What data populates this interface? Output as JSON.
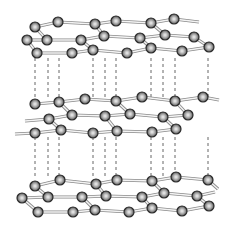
{
  "diagram": {
    "width": 235,
    "height": 229,
    "atom_radius": 5,
    "colors": {
      "background": "#ffffff",
      "atom_outline": "#2a2a2a",
      "atom_highlight": "#e8e8e8",
      "atom_shade": "#6e6e6e",
      "bond": "#8a8a8a",
      "dashed_line": "#555555"
    },
    "dashed_lines": {
      "x": [
        35,
        48,
        59,
        93,
        105,
        116,
        151,
        163,
        175,
        208
      ],
      "segments": [
        [
          58,
          98
        ],
        [
          137,
          176
        ]
      ]
    },
    "layers": [
      {
        "name": "top-layer",
        "atoms": [
          [
            35,
            27
          ],
          [
            58,
            22
          ],
          [
            95,
            24
          ],
          [
            116,
            21
          ],
          [
            151,
            23
          ],
          [
            174,
            19
          ],
          [
            27,
            40
          ],
          [
            47,
            40
          ],
          [
            81,
            40
          ],
          [
            104,
            36
          ],
          [
            140,
            38
          ],
          [
            165,
            35
          ],
          [
            194,
            37
          ],
          [
            37,
            53
          ],
          [
            72,
            53
          ],
          [
            93,
            50
          ],
          [
            127,
            53
          ],
          [
            151,
            48
          ],
          [
            182,
            51
          ],
          [
            209,
            47
          ]
        ],
        "bonds": [
          [
            35,
            27,
            58,
            22
          ],
          [
            58,
            22,
            95,
            24
          ],
          [
            95,
            24,
            116,
            21
          ],
          [
            116,
            21,
            151,
            23
          ],
          [
            151,
            23,
            174,
            19
          ],
          [
            174,
            19,
            199,
            22
          ],
          [
            35,
            27,
            47,
            40
          ],
          [
            95,
            24,
            104,
            36
          ],
          [
            151,
            23,
            165,
            35
          ],
          [
            27,
            40,
            47,
            40
          ],
          [
            47,
            40,
            81,
            40
          ],
          [
            81,
            40,
            104,
            36
          ],
          [
            104,
            36,
            140,
            38
          ],
          [
            140,
            38,
            165,
            35
          ],
          [
            165,
            35,
            194,
            37
          ],
          [
            27,
            40,
            37,
            53
          ],
          [
            81,
            40,
            93,
            50
          ],
          [
            140,
            38,
            151,
            48
          ],
          [
            194,
            37,
            209,
            47
          ],
          [
            37,
            53,
            72,
            53
          ],
          [
            72,
            53,
            93,
            50
          ],
          [
            93,
            50,
            127,
            53
          ],
          [
            127,
            53,
            151,
            48
          ],
          [
            151,
            48,
            182,
            51
          ],
          [
            182,
            51,
            209,
            47
          ]
        ]
      },
      {
        "name": "middle-layer",
        "atoms": [
          [
            35,
            104
          ],
          [
            59,
            102
          ],
          [
            85,
            99
          ],
          [
            116,
            101
          ],
          [
            142,
            97
          ],
          [
            175,
            101
          ],
          [
            203,
            97
          ],
          [
            49,
            119
          ],
          [
            72,
            115
          ],
          [
            105,
            116
          ],
          [
            130,
            114
          ],
          [
            163,
            117
          ],
          [
            188,
            115
          ],
          [
            35,
            133
          ],
          [
            61,
            130
          ],
          [
            93,
            133
          ],
          [
            117,
            131
          ],
          [
            152,
            132
          ],
          [
            176,
            129
          ]
        ],
        "bonds": [
          [
            35,
            104,
            59,
            102
          ],
          [
            59,
            102,
            85,
            99
          ],
          [
            85,
            99,
            116,
            101
          ],
          [
            116,
            101,
            142,
            97
          ],
          [
            142,
            97,
            175,
            101
          ],
          [
            175,
            101,
            203,
            97
          ],
          [
            203,
            97,
            219,
            100
          ],
          [
            59,
            102,
            72,
            115
          ],
          [
            116,
            101,
            130,
            114
          ],
          [
            175,
            101,
            188,
            115
          ],
          [
            25,
            121,
            49,
            119
          ],
          [
            49,
            119,
            72,
            115
          ],
          [
            72,
            115,
            105,
            116
          ],
          [
            105,
            116,
            130,
            114
          ],
          [
            130,
            114,
            163,
            117
          ],
          [
            163,
            117,
            188,
            115
          ],
          [
            49,
            119,
            61,
            130
          ],
          [
            105,
            116,
            117,
            131
          ],
          [
            163,
            117,
            176,
            129
          ],
          [
            15,
            134,
            35,
            133
          ],
          [
            35,
            133,
            61,
            130
          ],
          [
            61,
            130,
            93,
            133
          ],
          [
            93,
            133,
            117,
            131
          ],
          [
            117,
            131,
            152,
            132
          ],
          [
            152,
            132,
            176,
            129
          ]
        ]
      },
      {
        "name": "bottom-layer",
        "atoms": [
          [
            35,
            186
          ],
          [
            60,
            180
          ],
          [
            96,
            184
          ],
          [
            117,
            180
          ],
          [
            152,
            181
          ],
          [
            176,
            177
          ],
          [
            208,
            180
          ],
          [
            22,
            198
          ],
          [
            48,
            197
          ],
          [
            82,
            197
          ],
          [
            106,
            196
          ],
          [
            142,
            197
          ],
          [
            164,
            193
          ],
          [
            197,
            196
          ],
          [
            38,
            212
          ],
          [
            73,
            212
          ],
          [
            95,
            210
          ],
          [
            129,
            212
          ],
          [
            152,
            208
          ],
          [
            182,
            211
          ],
          [
            209,
            206
          ]
        ],
        "bonds": [
          [
            35,
            186,
            60,
            180
          ],
          [
            60,
            180,
            96,
            184
          ],
          [
            96,
            184,
            117,
            180
          ],
          [
            117,
            180,
            152,
            181
          ],
          [
            152,
            181,
            176,
            177
          ],
          [
            176,
            177,
            208,
            180
          ],
          [
            208,
            180,
            218,
            189
          ],
          [
            35,
            186,
            48,
            197
          ],
          [
            96,
            184,
            106,
            196
          ],
          [
            152,
            181,
            164,
            193
          ],
          [
            22,
            198,
            48,
            197
          ],
          [
            48,
            197,
            82,
            197
          ],
          [
            82,
            197,
            106,
            196
          ],
          [
            106,
            196,
            142,
            197
          ],
          [
            142,
            197,
            164,
            193
          ],
          [
            164,
            193,
            197,
            196
          ],
          [
            197,
            196,
            215,
            192
          ],
          [
            22,
            198,
            38,
            212
          ],
          [
            82,
            197,
            95,
            210
          ],
          [
            142,
            197,
            152,
            208
          ],
          [
            197,
            196,
            209,
            206
          ],
          [
            38,
            212,
            73,
            212
          ],
          [
            73,
            212,
            95,
            210
          ],
          [
            95,
            210,
            129,
            212
          ],
          [
            129,
            212,
            152,
            208
          ],
          [
            152,
            208,
            182,
            211
          ],
          [
            182,
            211,
            209,
            206
          ]
        ]
      }
    ]
  }
}
